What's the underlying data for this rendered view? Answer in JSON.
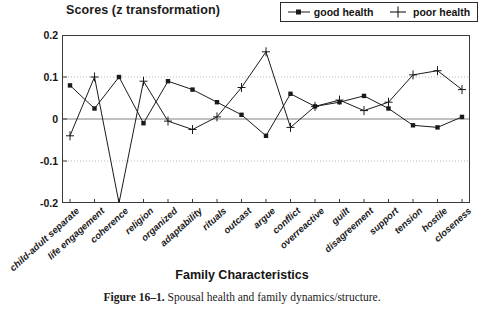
{
  "figure": {
    "caption_label": "Figure 16–1.",
    "caption_text": "Spousal health and family dynamics/structure."
  },
  "legend": {
    "entries": [
      {
        "label": "good health",
        "marker": "square-marker-icon",
        "color": "#1a1a1a"
      },
      {
        "label": "poor health",
        "marker": "plus-marker-icon",
        "color": "#1a1a1a"
      }
    ]
  },
  "chart_data": {
    "type": "line",
    "title": "Scores  (z transformation)",
    "xlabel": "Family Characteristics",
    "ylabel": "",
    "ylim": [
      -0.2,
      0.2
    ],
    "yticks": [
      "0.2",
      "0.1",
      "0",
      "-0.1",
      "-0.2"
    ],
    "ytick_values": [
      0.2,
      0.1,
      0,
      -0.1,
      -0.2
    ],
    "grid": "horizontal-dotted-at-0.1-and--0.1",
    "legend_position": "top-right",
    "categories": [
      "child-adult separate",
      "life engagement",
      "coherence",
      "religion",
      "organized",
      "adaptability",
      "rituals",
      "outcast",
      "argue",
      "conflict",
      "overreactive",
      "guilt",
      "disagreement",
      "support",
      "tension",
      "hostile",
      "closeness"
    ],
    "series": [
      {
        "name": "good health",
        "marker": "square",
        "color": "#1a1a1a",
        "values": [
          0.08,
          0.025,
          0.1,
          -0.01,
          0.09,
          0.07,
          0.04,
          0.01,
          -0.04,
          0.06,
          0.03,
          0.04,
          0.055,
          0.025,
          -0.015,
          -0.02,
          0.005
        ]
      },
      {
        "name": "poor health",
        "marker": "plus",
        "color": "#1a1a1a",
        "values": [
          -0.04,
          0.1,
          -0.2,
          0.09,
          -0.005,
          -0.025,
          0.005,
          0.075,
          0.16,
          -0.02,
          0.03,
          0.045,
          0.02,
          0.04,
          0.105,
          0.115,
          0.07
        ]
      }
    ]
  }
}
